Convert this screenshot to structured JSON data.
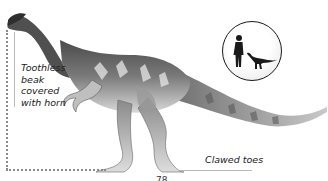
{
  "illustration": {
    "subject": "dinosaur-side-view",
    "palette": {
      "dark": "#3a3a3a",
      "mid": "#8c8c8c",
      "light": "#d9d9d9",
      "pale": "#eeeeee"
    }
  },
  "annotations": {
    "beak": "Toothless beak covered with horn",
    "beak_lines": [
      "Toothless",
      "beak",
      "covered",
      "with horn"
    ],
    "toes": "Clawed toes"
  },
  "scale_inset": {
    "figures": [
      "human-silhouette",
      "dinosaur-silhouette"
    ]
  },
  "page": {
    "number": "78"
  }
}
